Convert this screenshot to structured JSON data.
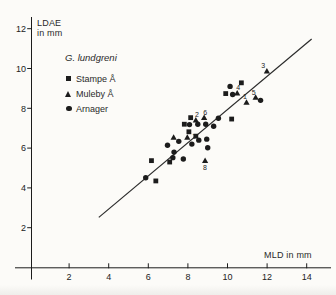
{
  "figure": {
    "y_axis_label_line1": "LDAE",
    "y_axis_label_line2": "in mm",
    "x_axis_label": "MLD in mm",
    "background": "#fcfbf8",
    "ink_color": "#1c1c1c"
  },
  "legend": {
    "title": "G. lundgreni",
    "items": [
      {
        "marker": "square-icon",
        "label": "Stampe Å"
      },
      {
        "marker": "triangle-icon",
        "label": "Muleby Å"
      },
      {
        "marker": "circle-icon",
        "label": "Arnager"
      }
    ]
  },
  "chart_data": {
    "type": "scatter",
    "title": "",
    "xlabel": "MLD in mm",
    "ylabel": "LDAE in mm",
    "xlim": [
      0,
      15.3
    ],
    "ylim": [
      0,
      12.7
    ],
    "x_ticks": [
      2,
      4,
      6,
      8,
      10,
      12,
      14
    ],
    "y_ticks": [
      2,
      4,
      6,
      8,
      10,
      12
    ],
    "grid": false,
    "legend_position": "upper-left",
    "marker_color": "#1c1c1c",
    "series": [
      {
        "name": "Stampe Å",
        "marker": "square",
        "points": [
          [
            6.16,
            5.37
          ],
          [
            6.38,
            4.35
          ],
          [
            7.08,
            5.3
          ],
          [
            7.82,
            7.2
          ],
          [
            8.05,
            6.82
          ],
          [
            8.14,
            7.53
          ],
          [
            8.4,
            6.6
          ],
          [
            9.91,
            8.74
          ],
          [
            10.21,
            7.46
          ],
          [
            10.7,
            9.28
          ]
        ]
      },
      {
        "name": "Muleby Å",
        "marker": "triangle",
        "points": [
          [
            7.28,
            6.55
          ],
          [
            7.97,
            6.55
          ],
          [
            8.4,
            7.41
          ],
          [
            8.82,
            7.54
          ],
          [
            8.87,
            5.38
          ],
          [
            10.49,
            8.77
          ],
          [
            10.96,
            8.3
          ],
          [
            11.42,
            8.55
          ],
          [
            11.99,
            9.87
          ]
        ]
      },
      {
        "name": "Arnager",
        "marker": "circle",
        "points": [
          [
            5.87,
            4.51
          ],
          [
            6.97,
            6.14
          ],
          [
            7.24,
            5.52
          ],
          [
            7.3,
            5.8
          ],
          [
            7.54,
            6.34
          ],
          [
            7.77,
            5.45
          ],
          [
            8.08,
            7.18
          ],
          [
            8.2,
            6.2
          ],
          [
            8.5,
            7.2
          ],
          [
            8.55,
            6.4
          ],
          [
            8.9,
            7.2
          ],
          [
            8.95,
            6.45
          ],
          [
            9.0,
            6.02
          ],
          [
            9.3,
            7.1
          ],
          [
            9.54,
            7.5
          ],
          [
            10.13,
            9.1
          ],
          [
            10.26,
            8.69
          ],
          [
            11.67,
            8.4
          ]
        ]
      }
    ],
    "point_labels": [
      {
        "text": "1",
        "x": 10.88,
        "y": 8.6
      },
      {
        "text": "2",
        "x": 8.46,
        "y": 7.66
      },
      {
        "text": "3",
        "x": 11.8,
        "y": 10.15
      },
      {
        "text": "4",
        "x": 10.54,
        "y": 9.02
      },
      {
        "text": "5",
        "x": 11.32,
        "y": 8.79
      },
      {
        "text": "6",
        "x": 8.88,
        "y": 7.76
      },
      {
        "text": "7",
        "x": 8.33,
        "y": 6.56
      },
      {
        "text": "8",
        "x": 8.86,
        "y": 5.02
      }
    ],
    "trend_line": {
      "x1": 3.5,
      "y1": 2.52,
      "x2": 14.25,
      "y2": 11.48
    }
  }
}
